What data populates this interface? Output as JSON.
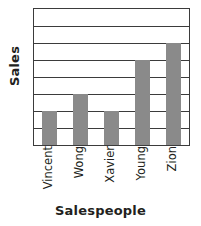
{
  "chart_data": {
    "type": "bar",
    "title": "",
    "categories": [
      "Vincent",
      "Wong",
      "Xavier",
      "Young",
      "Zion"
    ],
    "values": [
      2,
      3,
      2,
      5,
      6
    ],
    "series": [
      {
        "name": "Sales",
        "values": [
          2,
          3,
          2,
          5,
          6
        ]
      }
    ],
    "xlabel": "Salespeople",
    "ylabel": "Sales",
    "ylim": [
      0,
      8
    ],
    "ytick_values": [
      0,
      1,
      2,
      3,
      4,
      5,
      6,
      7,
      8
    ],
    "ytick_labels": [
      "",
      "",
      "",
      "",
      "",
      "",
      "",
      "",
      ""
    ],
    "gridlines": true,
    "gridline_count": 9,
    "legend": false,
    "legend_position": "none",
    "bar_color": "#8a8a8a",
    "axis_color": "#3b3b3b",
    "background_color": "#ffffff",
    "bar_width_fraction": 0.48
  },
  "axes": {
    "y_title": "Sales",
    "x_title": "Salespeople"
  },
  "categories": [
    {
      "label": "Vincent"
    },
    {
      "label": "Wong"
    },
    {
      "label": "Xavier"
    },
    {
      "label": "Young"
    },
    {
      "label": "Zion"
    }
  ]
}
